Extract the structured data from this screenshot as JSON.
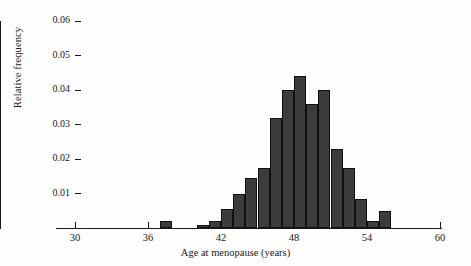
{
  "chart_data": {
    "type": "bar",
    "title": "",
    "subtitle": "",
    "xlabel": "Age at menopause (years)",
    "ylabel": "Relative frequency",
    "xlim": [
      30,
      60
    ],
    "ylim": [
      0,
      0.06
    ],
    "xticks": [
      30,
      36,
      42,
      48,
      54,
      60
    ],
    "xtick_labels": [
      "30",
      "36",
      "42",
      "48",
      "54",
      "60"
    ],
    "yticks": [
      0.01,
      0.02,
      0.03,
      0.04,
      0.05,
      0.06
    ],
    "ytick_labels": [
      "0.01",
      "0.02",
      "0.03",
      "0.04",
      "0.05",
      "0.06"
    ],
    "grid": false,
    "legend": null,
    "bin_width": 1,
    "bar_color": "#3c3c3c",
    "bar_edge_color": "#111111",
    "axis_color": "#1a1a1a",
    "background_color": "#ffffff",
    "categories": [
      37,
      40,
      41,
      42,
      43,
      44,
      45,
      46,
      47,
      48,
      49,
      50,
      51,
      52,
      53,
      54,
      55
    ],
    "values": [
      0.002,
      0.001,
      0.002,
      0.0055,
      0.01,
      0.0145,
      0.0175,
      0.032,
      0.04,
      0.044,
      0.036,
      0.04,
      0.023,
      0.0175,
      0.0085,
      0.002,
      0.005
    ],
    "bars": [
      {
        "bin_start": 37,
        "bin_end": 38,
        "value": 0.002
      },
      {
        "bin_start": 40,
        "bin_end": 41,
        "value": 0.001
      },
      {
        "bin_start": 41,
        "bin_end": 42,
        "value": 0.002
      },
      {
        "bin_start": 42,
        "bin_end": 43,
        "value": 0.0055
      },
      {
        "bin_start": 43,
        "bin_end": 44,
        "value": 0.01
      },
      {
        "bin_start": 44,
        "bin_end": 45,
        "value": 0.0145
      },
      {
        "bin_start": 45,
        "bin_end": 46,
        "value": 0.0175
      },
      {
        "bin_start": 46,
        "bin_end": 47,
        "value": 0.032
      },
      {
        "bin_start": 47,
        "bin_end": 48,
        "value": 0.04
      },
      {
        "bin_start": 48,
        "bin_end": 49,
        "value": 0.044
      },
      {
        "bin_start": 49,
        "bin_end": 50,
        "value": 0.036
      },
      {
        "bin_start": 50,
        "bin_end": 51,
        "value": 0.04
      },
      {
        "bin_start": 51,
        "bin_end": 52,
        "value": 0.023
      },
      {
        "bin_start": 52,
        "bin_end": 53,
        "value": 0.0175
      },
      {
        "bin_start": 53,
        "bin_end": 54,
        "value": 0.0085
      },
      {
        "bin_start": 54,
        "bin_end": 55,
        "value": 0.002
      },
      {
        "bin_start": 55,
        "bin_end": 56,
        "value": 0.005
      }
    ]
  }
}
